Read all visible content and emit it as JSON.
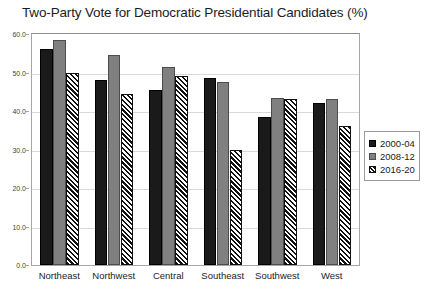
{
  "chart_data": {
    "type": "bar",
    "title": "Two-Party Vote for Democratic Presidential Candidates (%)",
    "xlabel": "",
    "ylabel": "",
    "ylim": [
      0.0,
      60.0
    ],
    "ytick_step": 10.0,
    "ytick_labels": [
      "0.0",
      "10.0",
      "20.0",
      "30.0",
      "40.0",
      "50.0",
      "60.0"
    ],
    "grid": true,
    "legend_position": "right",
    "categories": [
      "Northeast",
      "Northwest",
      "Central",
      "Southeast",
      "Southwest",
      "West"
    ],
    "series": [
      {
        "name": "2000-04",
        "color": "#1a1a1a",
        "pattern": "solid",
        "values": [
          56.0,
          48.0,
          45.5,
          48.5,
          38.5,
          42.0
        ]
      },
      {
        "name": "2008-12",
        "color": "#808080",
        "pattern": "solid",
        "values": [
          58.5,
          54.5,
          51.5,
          47.5,
          43.5,
          43.0
        ]
      },
      {
        "name": "2016-20",
        "color": "#ffffff",
        "pattern": "diagonal-hatch",
        "values": [
          50.0,
          44.5,
          49.0,
          30.0,
          43.0,
          36.0
        ]
      }
    ]
  }
}
